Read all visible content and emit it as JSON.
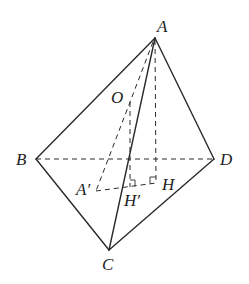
{
  "diagram": {
    "type": "tetrahedron",
    "stroke_color": "#2a2a2a",
    "points": {
      "A": {
        "label": "A",
        "x": 155,
        "y": 38
      },
      "B": {
        "label": "B",
        "x": 36,
        "y": 159
      },
      "C": {
        "label": "C",
        "x": 109,
        "y": 250
      },
      "D": {
        "label": "D",
        "x": 214,
        "y": 159
      },
      "O": {
        "label": "O",
        "x": 131,
        "y": 100
      },
      "H": {
        "label": "H",
        "x": 156,
        "y": 183
      },
      "A1": {
        "label": "A′",
        "x": 96,
        "y": 191
      },
      "H1": {
        "label": "H′",
        "x": 130,
        "y": 187
      }
    },
    "solid_edges": [
      "AB",
      "AC",
      "AD",
      "BC",
      "CD"
    ],
    "dashed_edges": [
      "BD",
      "AH",
      "AA′",
      "OH′",
      "A′H"
    ],
    "right_angle_marks": [
      "H",
      "H′"
    ]
  }
}
